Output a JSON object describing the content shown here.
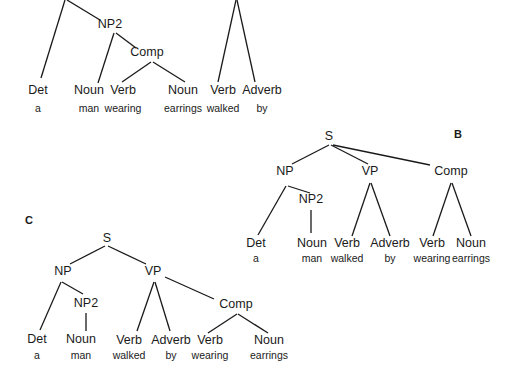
{
  "figure": {
    "panels": [
      {
        "id": "A",
        "label": "",
        "label_pos": null,
        "nodes": [
          {
            "id": "NP2",
            "text": "NP2",
            "x": 110,
            "y": 28
          },
          {
            "id": "Comp",
            "text": "Comp",
            "x": 147,
            "y": 56
          },
          {
            "id": "Det",
            "text": "Det",
            "x": 38,
            "y": 94
          },
          {
            "id": "Noun1",
            "text": "Noun",
            "x": 89,
            "y": 94
          },
          {
            "id": "Verb1",
            "text": "Verb",
            "x": 123,
            "y": 94
          },
          {
            "id": "Noun2",
            "text": "Noun",
            "x": 183,
            "y": 94
          },
          {
            "id": "Verb2",
            "text": "Verb",
            "x": 223,
            "y": 94
          },
          {
            "id": "Adverb",
            "text": "Adverb",
            "x": 262,
            "y": 94
          }
        ],
        "words": [
          {
            "text": "a",
            "x": 38,
            "y": 112
          },
          {
            "text": "man",
            "x": 89,
            "y": 112
          },
          {
            "text": "wearing",
            "x": 123,
            "y": 112
          },
          {
            "text": "earrings",
            "x": 183,
            "y": 112
          },
          {
            "text": "walked",
            "x": 223,
            "y": 112
          },
          {
            "text": "by",
            "x": 262,
            "y": 112
          }
        ],
        "edges": [
          [
            65,
            0,
            41,
            78
          ],
          [
            67,
            0,
            100,
            20
          ],
          [
            114,
            33,
            98,
            83
          ],
          [
            116,
            33,
            136,
            48
          ],
          [
            151,
            62,
            122,
            82
          ],
          [
            153,
            62,
            185,
            82
          ],
          [
            236,
            0,
            218,
            82
          ],
          [
            237,
            0,
            255,
            82
          ]
        ]
      },
      {
        "id": "B",
        "label": "B",
        "label_pos": {
          "x": 458,
          "y": 138
        },
        "nodes": [
          {
            "id": "S",
            "text": "S",
            "x": 329,
            "y": 140
          },
          {
            "id": "NP",
            "text": "NP",
            "x": 285,
            "y": 175
          },
          {
            "id": "VP",
            "text": "VP",
            "x": 370,
            "y": 175
          },
          {
            "id": "Comp",
            "text": "Comp",
            "x": 451,
            "y": 175
          },
          {
            "id": "NP2",
            "text": "NP2",
            "x": 311,
            "y": 203
          },
          {
            "id": "Det",
            "text": "Det",
            "x": 256,
            "y": 247
          },
          {
            "id": "Noun1",
            "text": "Noun",
            "x": 312,
            "y": 247
          },
          {
            "id": "Verb1",
            "text": "Verb",
            "x": 347,
            "y": 247
          },
          {
            "id": "Adverb",
            "text": "Adverb",
            "x": 390,
            "y": 247
          },
          {
            "id": "Verb2",
            "text": "Verb",
            "x": 432,
            "y": 247
          },
          {
            "id": "Noun2",
            "text": "Noun",
            "x": 471,
            "y": 247
          }
        ],
        "words": [
          {
            "text": "a",
            "x": 256,
            "y": 262
          },
          {
            "text": "man",
            "x": 312,
            "y": 262
          },
          {
            "text": "walked",
            "x": 347,
            "y": 262
          },
          {
            "text": "by",
            "x": 390,
            "y": 262
          },
          {
            "text": "wearing",
            "x": 432,
            "y": 262
          },
          {
            "text": "earrings",
            "x": 471,
            "y": 262
          }
        ],
        "edges": [
          [
            329,
            145,
            292,
            164
          ],
          [
            331,
            145,
            368,
            164
          ],
          [
            333,
            145,
            430,
            165
          ],
          [
            286,
            186,
            258,
            235
          ],
          [
            288,
            186,
            310,
            193
          ],
          [
            311,
            210,
            311,
            233
          ],
          [
            370,
            183,
            352,
            236
          ],
          [
            371,
            183,
            390,
            236
          ],
          [
            451,
            183,
            433,
            236
          ],
          [
            452,
            183,
            471,
            236
          ]
        ]
      },
      {
        "id": "C",
        "label": "C",
        "label_pos": {
          "x": 29,
          "y": 224
        },
        "nodes": [
          {
            "id": "S",
            "text": "S",
            "x": 107,
            "y": 242
          },
          {
            "id": "NP",
            "text": "NP",
            "x": 63,
            "y": 275
          },
          {
            "id": "VP",
            "text": "VP",
            "x": 153,
            "y": 275
          },
          {
            "id": "NP2",
            "text": "NP2",
            "x": 86,
            "y": 307
          },
          {
            "id": "Comp",
            "text": "Comp",
            "x": 236,
            "y": 308
          },
          {
            "id": "Det",
            "text": "Det",
            "x": 37,
            "y": 343
          },
          {
            "id": "Noun1",
            "text": "Noun",
            "x": 81,
            "y": 343
          },
          {
            "id": "Verb1",
            "text": "Verb",
            "x": 129,
            "y": 344
          },
          {
            "id": "Adverb",
            "text": "Adverb",
            "x": 171,
            "y": 344
          },
          {
            "id": "Verb2",
            "text": "Verb",
            "x": 210,
            "y": 344
          },
          {
            "id": "Noun2",
            "text": "Noun",
            "x": 269,
            "y": 344
          }
        ],
        "words": [
          {
            "text": "a",
            "x": 37,
            "y": 359
          },
          {
            "text": "man",
            "x": 81,
            "y": 359
          },
          {
            "text": "walked",
            "x": 129,
            "y": 359
          },
          {
            "text": "by",
            "x": 171,
            "y": 359
          },
          {
            "text": "wearing",
            "x": 210,
            "y": 359
          },
          {
            "text": "earrings",
            "x": 269,
            "y": 359
          }
        ],
        "edges": [
          [
            105,
            246,
            70,
            264
          ],
          [
            108,
            246,
            146,
            264
          ],
          [
            61,
            282,
            40,
            330
          ],
          [
            62,
            282,
            83,
            294
          ],
          [
            86,
            313,
            86,
            331
          ],
          [
            154,
            282,
            137,
            331
          ],
          [
            155,
            282,
            170,
            331
          ],
          [
            165,
            277,
            214,
            299
          ],
          [
            237,
            314,
            208,
            333
          ],
          [
            238,
            314,
            268,
            333
          ]
        ]
      }
    ]
  }
}
